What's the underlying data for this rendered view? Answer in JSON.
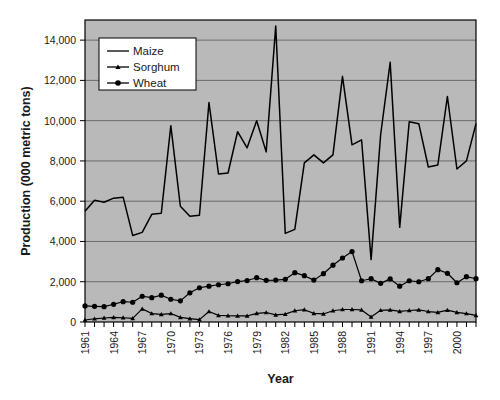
{
  "chart_data": {
    "type": "line",
    "title": "",
    "xlabel": "Year",
    "ylabel": "Production (000 metric tons)",
    "xlim": [
      1961,
      2002
    ],
    "ylim": [
      0,
      15000
    ],
    "yticks": [
      0,
      2000,
      4000,
      6000,
      8000,
      10000,
      12000,
      14000
    ],
    "ytick_labels": [
      "0",
      "2,000",
      "4,000",
      "6,000",
      "8,000",
      "10,000",
      "12,000",
      "14,000"
    ],
    "xticks": [
      1961,
      1964,
      1967,
      1970,
      1973,
      1976,
      1979,
      1982,
      1985,
      1988,
      1991,
      1994,
      1997,
      2000
    ],
    "xtick_labels": [
      "1961",
      "1964",
      "1967",
      "1970",
      "1973",
      "1976",
      "1979",
      "1982",
      "1985",
      "1988",
      "1991",
      "1994",
      "1997",
      "2000"
    ],
    "grid": "horizontal",
    "legend_position": "top-left-inside",
    "plot_background": "#b9b9b9",
    "figure_background": "#ffffff",
    "line_color": "#000000",
    "x": [
      1961,
      1962,
      1963,
      1964,
      1965,
      1966,
      1967,
      1968,
      1969,
      1970,
      1971,
      1972,
      1973,
      1974,
      1975,
      1976,
      1977,
      1978,
      1979,
      1980,
      1981,
      1982,
      1983,
      1984,
      1985,
      1986,
      1987,
      1988,
      1989,
      1990,
      1991,
      1992,
      1993,
      1994,
      1995,
      1996,
      1997,
      1998,
      1999,
      2000,
      2001,
      2002
    ],
    "series": [
      {
        "name": "Maize",
        "marker": "none",
        "values": [
          5500,
          6050,
          5950,
          6150,
          6200,
          4300,
          4450,
          5350,
          5400,
          9750,
          5750,
          5250,
          5300,
          10900,
          7350,
          7400,
          9450,
          8650,
          10000,
          8450,
          14700,
          4400,
          4600,
          7900,
          8300,
          7900,
          8300,
          12200,
          8800,
          9050,
          3100,
          9300,
          12900,
          4700,
          9950,
          9850,
          7700,
          7800,
          11200,
          7600,
          8000,
          9850
        ]
      },
      {
        "name": "Sorghum",
        "marker": "triangle",
        "values": [
          100,
          160,
          200,
          230,
          210,
          180,
          650,
          420,
          380,
          420,
          230,
          170,
          120,
          520,
          330,
          310,
          300,
          300,
          430,
          470,
          350,
          390,
          560,
          610,
          430,
          400,
          560,
          620,
          620,
          600,
          250,
          580,
          600,
          530,
          570,
          600,
          520,
          480,
          590,
          480,
          420,
          330
        ]
      },
      {
        "name": "Wheat",
        "marker": "circle",
        "values": [
          800,
          780,
          760,
          880,
          1010,
          980,
          1280,
          1210,
          1330,
          1130,
          1050,
          1450,
          1700,
          1780,
          1850,
          1900,
          2010,
          2060,
          2200,
          2070,
          2080,
          2120,
          2450,
          2300,
          2080,
          2400,
          2820,
          3180,
          3500,
          2050,
          2150,
          1920,
          2140,
          1780,
          2050,
          2000,
          2150,
          2600,
          2420,
          1950,
          2250,
          2150
        ]
      }
    ]
  },
  "legend": {
    "items": [
      {
        "label": "Maize",
        "marker": "none"
      },
      {
        "label": "Sorghum",
        "marker": "triangle"
      },
      {
        "label": "Wheat",
        "marker": "circle"
      }
    ]
  }
}
